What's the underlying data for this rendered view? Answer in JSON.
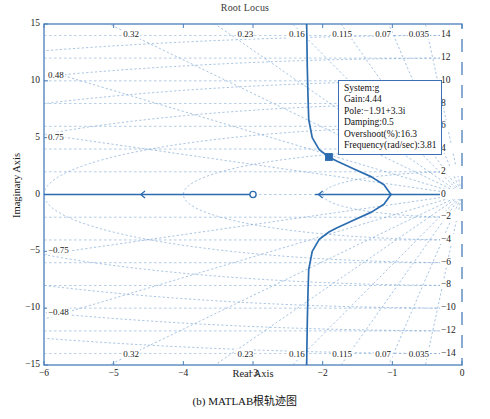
{
  "figure": {
    "title": "Root Locus",
    "xlabel": "Real Axis",
    "ylabel": "Imaginary Axis",
    "caption": "(b) MATLAB根轨迹图",
    "axis_color": "#4a7ebb",
    "locus_color": "#2b6cb0",
    "grid_color": "#6f9dd0"
  },
  "tooltip": {
    "system": "System:g",
    "gain": "Gain:4.44",
    "pole": "Pole:−1.91+3.3i",
    "damping": "Damping:0.5",
    "overshoot": "Overshoot(%):16.3",
    "frequency": "Frequency(rad/sec):3.81"
  },
  "chart_data": {
    "type": "line",
    "title": "Root Locus",
    "xlabel": "Real Axis",
    "ylabel": "Imaginary Axis",
    "xlim": [
      -6,
      0
    ],
    "ylim": [
      -15,
      15
    ],
    "grid": true,
    "legend": "none",
    "x_ticks": [
      -6,
      -5,
      -4,
      -3,
      -2,
      -1,
      0
    ],
    "x_tick_labels": [
      "−6",
      "−5",
      "−4",
      "−3",
      "−2",
      "−1",
      "0"
    ],
    "y_ticks": [
      -15,
      -10,
      -5,
      0,
      5,
      10,
      15
    ],
    "y_tick_labels": [
      "−15",
      "−10",
      "−5",
      "0",
      "5",
      "10",
      "15"
    ],
    "right_axis_label": "natural frequency (rad/sec)",
    "right_ticks": [
      14,
      12,
      10,
      8,
      6,
      4,
      2,
      0,
      -2,
      -4,
      -6,
      -8,
      -10,
      -12,
      -14
    ],
    "right_tick_labels": [
      "14",
      "12",
      "10",
      "8",
      "6",
      "4",
      "2",
      "0",
      "−2",
      "−4",
      "−6",
      "−8",
      "−10",
      "−12",
      "−14"
    ],
    "damping_labels_top": [
      {
        "value": "0.32",
        "x": -4.72
      },
      {
        "value": "0.23",
        "x": -3.08
      },
      {
        "value": "0.16",
        "x": -2.34
      },
      {
        "value": "0.115",
        "x": -1.72
      },
      {
        "value": "0.07",
        "x": -1.1
      },
      {
        "value": "0.035",
        "x": -0.62
      }
    ],
    "damping_labels_bottom": [
      {
        "value": "0.32",
        "x": -4.72
      },
      {
        "value": "0.23",
        "x": -3.08
      },
      {
        "value": "0.16",
        "x": -2.34
      },
      {
        "value": "0.115",
        "x": -1.72
      },
      {
        "value": "0.07",
        "x": -1.1
      },
      {
        "value": "0.035",
        "x": -0.62
      }
    ],
    "damping_labels_left_upper": [
      {
        "value": "0.48",
        "y": 10.4
      },
      {
        "value": "0.75",
        "y": 5.0
      }
    ],
    "damping_labels_left_lower": [
      {
        "value": "−0.75",
        "y": -5.0
      },
      {
        "value": "−0.48",
        "y": -10.4
      }
    ],
    "series": [
      {
        "name": "real-axis-branch-left",
        "points": [
          [
            -6.0,
            0
          ],
          [
            -3.0,
            0
          ]
        ]
      },
      {
        "name": "real-axis-branch-right",
        "points": [
          [
            -2.1,
            0
          ],
          [
            0.0,
            0
          ]
        ]
      },
      {
        "name": "complex-branch-upper",
        "points": [
          [
            -1.02,
            0.0
          ],
          [
            -1.12,
            0.85
          ],
          [
            -1.3,
            1.55
          ],
          [
            -1.55,
            2.25
          ],
          [
            -1.8,
            2.95
          ],
          [
            -1.91,
            3.3
          ],
          [
            -2.05,
            3.95
          ],
          [
            -2.15,
            5.0
          ],
          [
            -2.2,
            6.6
          ],
          [
            -2.21,
            8.5
          ],
          [
            -2.22,
            11.0
          ],
          [
            -2.23,
            15.0
          ]
        ]
      },
      {
        "name": "complex-branch-lower",
        "points": [
          [
            -1.02,
            0.0
          ],
          [
            -1.12,
            -0.85
          ],
          [
            -1.3,
            -1.55
          ],
          [
            -1.55,
            -2.25
          ],
          [
            -1.8,
            -2.95
          ],
          [
            -1.91,
            -3.3
          ],
          [
            -2.05,
            -3.95
          ],
          [
            -2.15,
            -5.0
          ],
          [
            -2.2,
            -6.6
          ],
          [
            -2.21,
            -8.5
          ],
          [
            -2.22,
            -11.0
          ],
          [
            -2.23,
            -15.0
          ]
        ]
      }
    ],
    "markers": [
      {
        "kind": "open-zero",
        "x": -3.0,
        "y": 0
      },
      {
        "kind": "selected-pole",
        "x": -1.91,
        "y": 3.3
      }
    ],
    "damping_ratios": [
      0.035,
      0.07,
      0.115,
      0.16,
      0.23,
      0.32,
      0.48,
      0.75
    ],
    "natural_frequency_circles": [
      2,
      4,
      6,
      8,
      10,
      12,
      14
    ]
  }
}
